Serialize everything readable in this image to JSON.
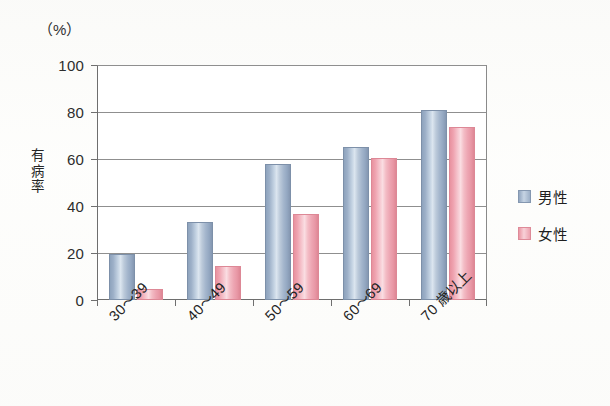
{
  "chart_data": {
    "type": "bar",
    "title": "",
    "subtitle": "",
    "xlabel": "",
    "ylabel": "有病率",
    "unit_label": "（%）",
    "ylim": [
      0,
      100
    ],
    "ytick_step": 20,
    "yticks": [
      "0",
      "20",
      "40",
      "60",
      "80",
      "100"
    ],
    "grid": true,
    "legend_position": "right",
    "categories": [
      "30〜39",
      "40〜49",
      "50〜59",
      "60〜69",
      "70 歳以上"
    ],
    "series": [
      {
        "name": "男性",
        "color": "#9badc8",
        "values": [
          19.5,
          33.0,
          58.0,
          65.0,
          81.0
        ]
      },
      {
        "name": "女性",
        "color": "#eea8b4",
        "values": [
          4.5,
          14.5,
          36.5,
          60.5,
          73.5
        ]
      }
    ]
  },
  "legend": {
    "items": [
      {
        "label": "男性",
        "swatch": "male-swatch-icon"
      },
      {
        "label": "女性",
        "swatch": "female-swatch-icon"
      }
    ]
  }
}
